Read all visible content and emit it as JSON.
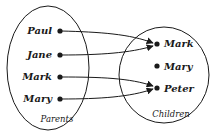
{
  "diagram": {
    "type": "set-mapping",
    "domain": {
      "label": "Parents",
      "elements": [
        "Paul",
        "Jane",
        "Mark",
        "Mary"
      ]
    },
    "codomain": {
      "label": "Children",
      "elements": [
        "Mark",
        "Mary",
        "Peter"
      ]
    },
    "mappings": [
      {
        "from": "Paul",
        "to": "Mark"
      },
      {
        "from": "Jane",
        "to": "Mark"
      },
      {
        "from": "Mark",
        "to": "Peter"
      },
      {
        "from": "Mary",
        "to": "Peter"
      }
    ],
    "colors": {
      "stroke": "#1a1a1a",
      "background": "#ffffff"
    }
  }
}
